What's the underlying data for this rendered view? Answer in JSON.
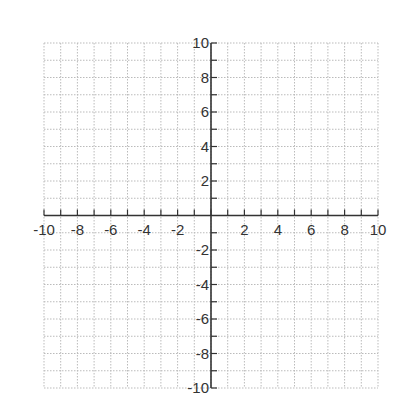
{
  "chart_data": {
    "type": "scatter",
    "title": "",
    "xlabel": "",
    "ylabel": "",
    "xlim": [
      -10,
      10
    ],
    "ylim": [
      -10,
      10
    ],
    "grid": true,
    "grid_style": "dotted",
    "grid_step": 1,
    "x_tick_labels": [
      "-10",
      "-8",
      "-6",
      "-4",
      "-2",
      "2",
      "4",
      "6",
      "8",
      "10"
    ],
    "x_tick_values": [
      -10,
      -8,
      -6,
      -4,
      -2,
      2,
      4,
      6,
      8,
      10
    ],
    "y_tick_labels": [
      "10",
      "8",
      "6",
      "4",
      "2",
      "-2",
      "-4",
      "-6",
      "-8",
      "-10"
    ],
    "y_tick_values": [
      10,
      8,
      6,
      4,
      2,
      -2,
      -4,
      -6,
      -8,
      -10
    ],
    "series": [],
    "legend": null
  },
  "colors": {
    "axis": "#333333",
    "grid": "#bbbbbb",
    "background": "#ffffff"
  }
}
